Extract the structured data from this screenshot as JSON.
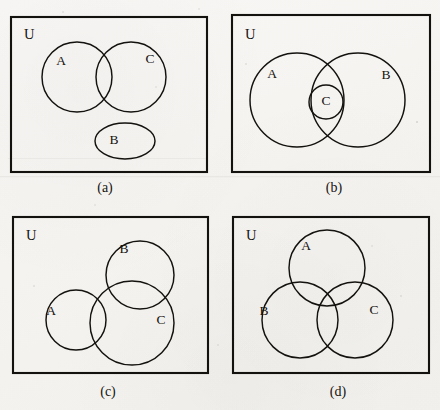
{
  "figure": {
    "background_color": "#f6f5f2",
    "ink_color": "#14120f",
    "kind": "set-theory venn diagram multiple-choice options"
  },
  "panels": [
    {
      "id": "a",
      "caption": "(a)",
      "caption_x": 105,
      "caption_y": 189,
      "universe_label": "U",
      "universe_label_x": 24,
      "universe_label_y": 36,
      "rect": {
        "x": 11,
        "y": 17,
        "width": 196,
        "height": 155
      },
      "shapes": [
        {
          "type": "circle",
          "label": "A",
          "cx": 77,
          "cy": 77,
          "r": 35,
          "label_x": 61,
          "label_y": 62
        },
        {
          "type": "circle",
          "label": "C",
          "cx": 131,
          "cy": 77,
          "r": 35,
          "label_x": 150,
          "label_y": 60
        },
        {
          "type": "ellipse",
          "label": "B",
          "cx": 125,
          "cy": 141,
          "rx": 30,
          "ry": 18,
          "label_x": 114,
          "label_y": 141
        }
      ],
      "relations": "A and C overlap; B is disjoint from both"
    },
    {
      "id": "b",
      "caption": "(b)",
      "caption_x": 334,
      "caption_y": 189,
      "universe_label": "U",
      "universe_label_x": 245,
      "universe_label_y": 36,
      "rect": {
        "x": 232,
        "y": 15,
        "width": 198,
        "height": 157
      },
      "shapes": [
        {
          "type": "circle",
          "label": "A",
          "cx": 297,
          "cy": 100,
          "r": 47,
          "label_x": 272,
          "label_y": 75
        },
        {
          "type": "circle",
          "label": "B",
          "cx": 358,
          "cy": 100,
          "r": 47,
          "label_x": 386,
          "label_y": 76
        },
        {
          "type": "circle",
          "label": "C",
          "cx": 326,
          "cy": 102,
          "r": 17,
          "label_x": 326,
          "label_y": 102
        }
      ],
      "relations": "A and B overlap; C lies inside the intersection of A and B"
    },
    {
      "id": "c",
      "caption": "(c)",
      "caption_x": 108,
      "caption_y": 393,
      "universe_label": "U",
      "universe_label_x": 26,
      "universe_label_y": 237,
      "rect": {
        "x": 13,
        "y": 217,
        "width": 195,
        "height": 156
      },
      "shapes": [
        {
          "type": "circle",
          "label": "B",
          "cx": 140,
          "cy": 275,
          "r": 34,
          "label_x": 124,
          "label_y": 250
        },
        {
          "type": "circle",
          "label": "C",
          "cx": 132,
          "cy": 323,
          "r": 42,
          "label_x": 161,
          "label_y": 321
        },
        {
          "type": "circle",
          "label": "A",
          "cx": 76,
          "cy": 320,
          "r": 30,
          "label_x": 51,
          "label_y": 312
        }
      ],
      "relations": "A overlaps C; B overlaps C; A and B are disjoint"
    },
    {
      "id": "d",
      "caption": "(d)",
      "caption_x": 338,
      "caption_y": 393,
      "universe_label": "U",
      "universe_label_x": 246,
      "universe_label_y": 237,
      "rect": {
        "x": 233,
        "y": 217,
        "width": 196,
        "height": 156
      },
      "shapes": [
        {
          "type": "circle",
          "label": "A",
          "cx": 327,
          "cy": 268,
          "r": 38,
          "label_x": 306,
          "label_y": 247
        },
        {
          "type": "circle",
          "label": "B",
          "cx": 300,
          "cy": 320,
          "r": 38,
          "label_x": 264,
          "label_y": 312
        },
        {
          "type": "circle",
          "label": "C",
          "cx": 355,
          "cy": 320,
          "r": 38,
          "label_x": 374,
          "label_y": 311
        }
      ],
      "relations": "A, B and C pairwise overlap meeting at a common point"
    }
  ]
}
